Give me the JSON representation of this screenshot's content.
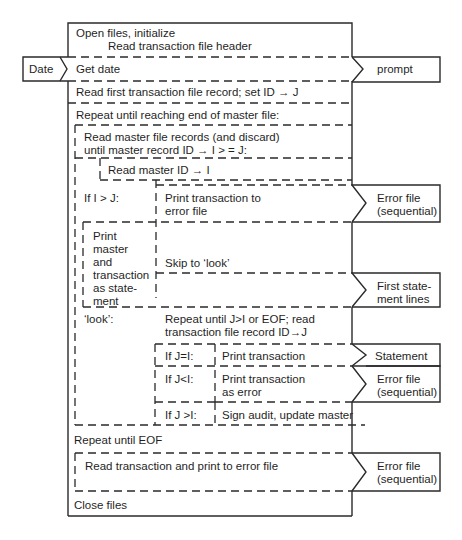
{
  "diagram": {
    "type": "structured-flowchart (Jackson/Nassi-style with data-flow chevrons)",
    "main_steps": {
      "open": "Open files, initialize",
      "read_header": "Read transaction file header",
      "get_date": "Get date",
      "read_first": "Read first transaction file record; set ID → J",
      "repeat_master": "Repeat until reaching end of master file:",
      "read_master_line1": "Read master file records (and discard)",
      "read_master_line2": "until master record ID → I > = J:",
      "read_master_id": "Read master ID → I",
      "if_i_gt_j": "If I > J:",
      "print_error_line1": "Print transaction to",
      "print_error_line2": "error file",
      "print_master_lines": [
        "Print",
        "master",
        "and",
        "transaction",
        "as state-",
        "ment"
      ],
      "skip_look": "Skip to ‘look’",
      "look_label": "‘look’:",
      "repeat_j_line1": "Repeat until J>I or EOF; read",
      "repeat_j_line2": "transaction file record ID→J",
      "if_j_eq_i": "If J=I:",
      "print_transaction": "Print transaction",
      "if_j_lt_i": "If J<I:",
      "print_as_error_line1": "Print transaction",
      "print_as_error_line2": "as error",
      "if_j_gt_i": "If J >I:",
      "sign_audit": "Sign audit, update master",
      "repeat_eof": "Repeat until EOF",
      "read_print_error": "Read transaction and print to error file",
      "close": "Close files"
    },
    "inputs": [
      {
        "label": "Date"
      }
    ],
    "outputs": {
      "prompt": "prompt",
      "error1_line1": "Error file",
      "error1_line2": "(sequential)",
      "first_stmt_line1": "First state-",
      "first_stmt_line2": "ment lines",
      "statement": "Statement",
      "error2_line1": "Error file",
      "error2_line2": "(sequential)",
      "error3_line1": "Error file",
      "error3_line2": "(sequential)"
    },
    "colors": {
      "line": "#2a2a2a",
      "text": "#1f1f1f",
      "background": "#ffffff"
    }
  }
}
